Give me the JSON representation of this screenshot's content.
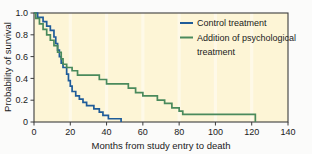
{
  "chart_data": {
    "type": "line",
    "title": "",
    "subtitle": "",
    "xlabel": "Months from study entry to death",
    "ylabel": "Probability of survival",
    "xlim": [
      0,
      140
    ],
    "ylim": [
      0,
      1.0
    ],
    "xticks": [
      0,
      20,
      40,
      60,
      80,
      100,
      120,
      140
    ],
    "xtick_labels": [
      "0",
      "20",
      "40",
      "60",
      "80",
      "100",
      "120",
      "140"
    ],
    "yticks": [
      0,
      0.2,
      0.4,
      0.6,
      0.8,
      1.0
    ],
    "ytick_labels": [
      "0",
      "0.2",
      "0.4",
      "0.6",
      "0.8",
      "1.0"
    ],
    "grid": false,
    "legend_position": "upper right",
    "plot_background": "#fdf5d6",
    "figure_background": "#fbfbfa",
    "axis_color": "#3c3c3c",
    "curve_style": "step",
    "series": [
      {
        "name": "Control treatment",
        "color": "#1f5c99",
        "points": [
          [
            0,
            1.0
          ],
          [
            2,
            1.0
          ],
          [
            2,
            0.96
          ],
          [
            5,
            0.96
          ],
          [
            5,
            0.92
          ],
          [
            7,
            0.92
          ],
          [
            7,
            0.88
          ],
          [
            9,
            0.88
          ],
          [
            9,
            0.84
          ],
          [
            11,
            0.84
          ],
          [
            11,
            0.78
          ],
          [
            12,
            0.78
          ],
          [
            12,
            0.72
          ],
          [
            13,
            0.72
          ],
          [
            13,
            0.66
          ],
          [
            14,
            0.66
          ],
          [
            14,
            0.6
          ],
          [
            15,
            0.6
          ],
          [
            15,
            0.54
          ],
          [
            16,
            0.54
          ],
          [
            16,
            0.5
          ],
          [
            18,
            0.5
          ],
          [
            18,
            0.44
          ],
          [
            19,
            0.44
          ],
          [
            19,
            0.38
          ],
          [
            20,
            0.38
          ],
          [
            20,
            0.33
          ],
          [
            21,
            0.33
          ],
          [
            21,
            0.28
          ],
          [
            23,
            0.28
          ],
          [
            23,
            0.24
          ],
          [
            25,
            0.24
          ],
          [
            25,
            0.21
          ],
          [
            27,
            0.21
          ],
          [
            27,
            0.18
          ],
          [
            29,
            0.18
          ],
          [
            29,
            0.15
          ],
          [
            33,
            0.15
          ],
          [
            33,
            0.12
          ],
          [
            36,
            0.12
          ],
          [
            36,
            0.09
          ],
          [
            38,
            0.09
          ],
          [
            38,
            0.06
          ],
          [
            41,
            0.06
          ],
          [
            41,
            0.03
          ],
          [
            48,
            0.03
          ],
          [
            48,
            0.0
          ]
        ]
      },
      {
        "name": "Addition of psychological treatment",
        "color": "#4a8a5c",
        "points": [
          [
            0,
            1.0
          ],
          [
            1,
            1.0
          ],
          [
            1,
            0.95
          ],
          [
            3,
            0.95
          ],
          [
            3,
            0.9
          ],
          [
            5,
            0.9
          ],
          [
            5,
            0.85
          ],
          [
            7,
            0.85
          ],
          [
            7,
            0.8
          ],
          [
            9,
            0.8
          ],
          [
            9,
            0.75
          ],
          [
            11,
            0.75
          ],
          [
            11,
            0.7
          ],
          [
            13,
            0.7
          ],
          [
            13,
            0.64
          ],
          [
            15,
            0.64
          ],
          [
            15,
            0.58
          ],
          [
            16,
            0.58
          ],
          [
            16,
            0.53
          ],
          [
            18,
            0.53
          ],
          [
            18,
            0.5
          ],
          [
            21,
            0.5
          ],
          [
            21,
            0.47
          ],
          [
            24,
            0.47
          ],
          [
            24,
            0.43
          ],
          [
            36,
            0.43
          ],
          [
            36,
            0.39
          ],
          [
            40,
            0.39
          ],
          [
            40,
            0.35
          ],
          [
            52,
            0.35
          ],
          [
            52,
            0.31
          ],
          [
            56,
            0.31
          ],
          [
            56,
            0.27
          ],
          [
            60,
            0.27
          ],
          [
            60,
            0.24
          ],
          [
            68,
            0.24
          ],
          [
            68,
            0.2
          ],
          [
            72,
            0.2
          ],
          [
            72,
            0.17
          ],
          [
            76,
            0.17
          ],
          [
            76,
            0.13
          ],
          [
            80,
            0.13
          ],
          [
            80,
            0.1
          ],
          [
            82,
            0.1
          ],
          [
            82,
            0.07
          ],
          [
            122,
            0.07
          ],
          [
            122,
            0.0
          ]
        ]
      }
    ],
    "legend": [
      {
        "label": "Control treatment",
        "color": "#1f5c99"
      },
      {
        "label": "Addition of psychological",
        "color": "#4a8a5c"
      },
      {
        "label": "treatment",
        "color": null
      }
    ]
  }
}
